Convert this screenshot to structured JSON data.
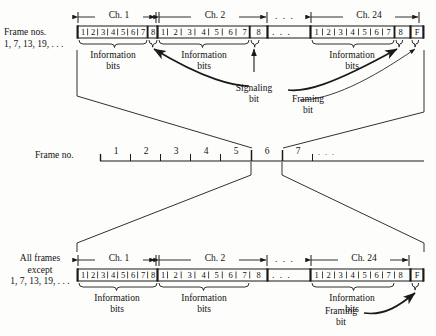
{
  "diagram": {
    "ink_color": "#1a1a1a",
    "background": "#fdfdfb"
  },
  "top_row": {
    "side_label_line1": "Frame nos.",
    "side_label_line2": "1, 7, 13, 19, . . .",
    "channels": [
      {
        "name": "Ch. 1",
        "bits": [
          "1",
          "2",
          "3",
          "4",
          "5",
          "6",
          "7",
          "8"
        ],
        "info_label_line1": "Information",
        "info_label_line2": "bits"
      },
      {
        "name": "Ch. 2",
        "bits": [
          "1",
          "2",
          "3",
          "4",
          "5",
          "6",
          "7",
          "8"
        ],
        "info_label_line1": "Information",
        "info_label_line2": "bits"
      },
      {
        "name": "Ch. 24",
        "bits": [
          "1",
          "2",
          "3",
          "4",
          "5",
          "6",
          "7",
          "8"
        ],
        "info_label_line1": "Information",
        "info_label_line2": "bits"
      }
    ],
    "ellipsis": ". . .",
    "framing_cell": "F",
    "callouts": [
      {
        "id": "signaling",
        "line1": "Signaling",
        "line2": "bit"
      },
      {
        "id": "framing",
        "line1": "Framing",
        "line2": "bit"
      }
    ]
  },
  "timeline": {
    "label": "Frame no.",
    "frames": [
      "1",
      "2",
      "3",
      "4",
      "5",
      "6",
      "7"
    ],
    "ellipsis": ". . ."
  },
  "bottom_row": {
    "side_label_line1": "All frames",
    "side_label_line2": "except",
    "side_label_line3": "1, 7, 13, 19, . . .",
    "channels": [
      {
        "name": "Ch. 1",
        "bits": [
          "1",
          "2",
          "3",
          "4",
          "5",
          "6",
          "7",
          "8"
        ],
        "info_label_line1": "Information",
        "info_label_line2": "bits"
      },
      {
        "name": "Ch. 2",
        "bits": [
          "1",
          "2",
          "3",
          "4",
          "5",
          "6",
          "7",
          "8"
        ],
        "info_label_line1": "Information",
        "info_label_line2": "bits"
      },
      {
        "name": "Ch. 24",
        "bits": [
          "1",
          "2",
          "3",
          "4",
          "5",
          "6",
          "7",
          "8"
        ],
        "info_label_line1": "Information",
        "info_label_line2": "bits"
      }
    ],
    "ellipsis": ". . .",
    "framing_cell": "F",
    "callouts": [
      {
        "id": "framing",
        "line1": "Framing",
        "line2": "bit"
      }
    ]
  }
}
